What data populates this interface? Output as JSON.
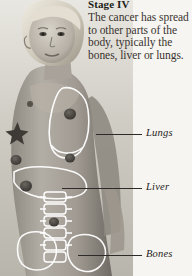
{
  "page": {
    "corner_fragment": "có",
    "background_color": "#f6f5f1"
  },
  "article": {
    "heading_label": "Stage",
    "heading_numeral": "IV",
    "body_text": "The cancer has spread to other parts of the body, typically the bones, liver or lungs."
  },
  "illustration": {
    "alt_description": "Grayscale photograph of a woman's head and torso in profile with anatomical overlay outlines of the lungs, liver, spine and pelvis, and dark spots indicating metastatic tumour sites.",
    "outline_color": "#ffffff",
    "tumor_color": "#4c4a46",
    "skin_tone": "#a9a49c"
  },
  "callouts": [
    {
      "id": "lungs",
      "label": "Lungs"
    },
    {
      "id": "liver",
      "label": "Liver"
    },
    {
      "id": "bones",
      "label": "Bones"
    }
  ]
}
